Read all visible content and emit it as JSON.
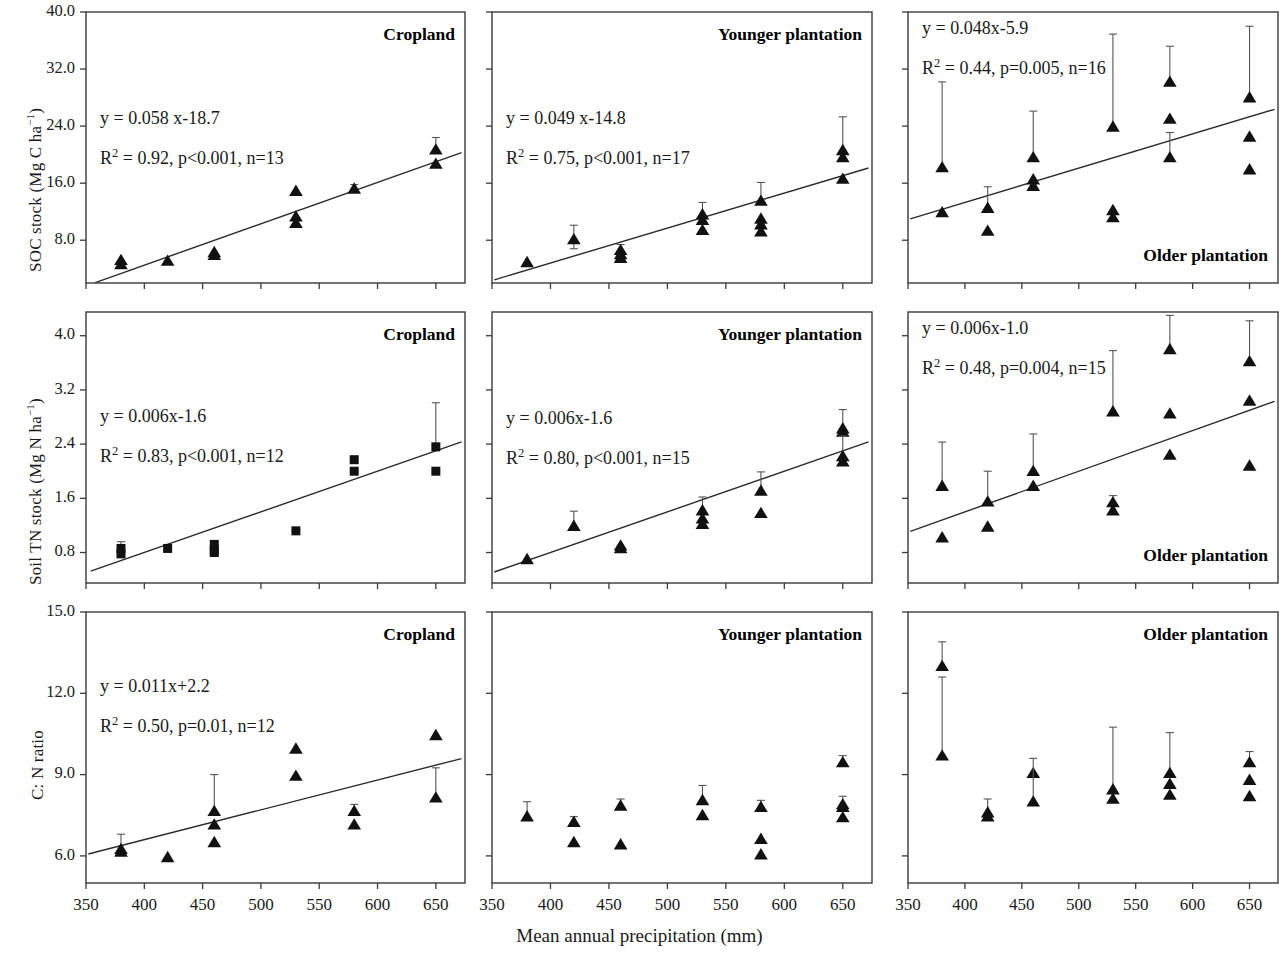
{
  "figure": {
    "xaxis_title": "Mean annual precipitation (mm)",
    "x_ticks": [
      "350",
      "400",
      "450",
      "500",
      "550",
      "600",
      "650"
    ],
    "x_tick_values": [
      350,
      400,
      450,
      500,
      550,
      600,
      650
    ],
    "xlim": [
      350,
      675
    ],
    "rows": [
      {
        "ylabel_main": "SOC stock (Mg C ha",
        "ylabel_sup": "−1",
        "ylabel_tail": ")",
        "y_ticks": [
          "8.0",
          "16.0",
          "24.0",
          "32.0",
          "40.0"
        ],
        "y_tick_values": [
          8.0,
          16.0,
          24.0,
          32.0,
          40.0
        ],
        "ylim": [
          2.0,
          40.0
        ]
      },
      {
        "ylabel_main": "Soil TN stock (Mg N ha",
        "ylabel_sup": "−1",
        "ylabel_tail": ")",
        "y_ticks": [
          "0.8",
          "1.6",
          "2.4",
          "3.2",
          "4.0"
        ],
        "y_tick_values": [
          0.8,
          1.6,
          2.4,
          3.2,
          4.0
        ],
        "ylim": [
          0.35,
          4.35
        ]
      },
      {
        "ylabel_main": "C: N ratio",
        "ylabel_sup": "",
        "ylabel_tail": "",
        "y_ticks": [
          "6.0",
          "9.0",
          "12.0",
          "15.0"
        ],
        "y_tick_values": [
          6.0,
          9.0,
          12.0,
          15.0
        ],
        "ylim": [
          5.0,
          15.0
        ]
      }
    ]
  },
  "chart_data": [
    {
      "id": "soc-cropland",
      "type": "scatter",
      "panel_title": "Cropland",
      "title_pos": "top-right",
      "marker": "triangle",
      "xlabel": "Mean annual precipitation (mm)",
      "ylabel": "SOC stock (Mg C ha-1)",
      "xlim": [
        350,
        675
      ],
      "ylim": [
        2.0,
        40.0
      ],
      "grid": false,
      "equation": "y = 0.058 x-18.7",
      "stats": "R2 = 0.92, p<0.001, n=13",
      "r2": "0.92",
      "p": "p<0.001",
      "n": "n=13",
      "fit": {
        "slope": 0.058,
        "intercept": -18.7,
        "x_start": 358,
        "x_end": 672
      },
      "points": [
        {
          "x": 380,
          "y": 5.2,
          "err_up": 0.0,
          "err_dn": 0.0
        },
        {
          "x": 380,
          "y": 4.6,
          "err_up": 0.0,
          "err_dn": 0.0
        },
        {
          "x": 420,
          "y": 5.1,
          "err_up": 0.0,
          "err_dn": 0.0
        },
        {
          "x": 460,
          "y": 6.3,
          "err_up": 0.0,
          "err_dn": 0.0
        },
        {
          "x": 460,
          "y": 5.9,
          "err_up": 0.0,
          "err_dn": 0.0
        },
        {
          "x": 530,
          "y": 14.9,
          "err_up": 0.0,
          "err_dn": 0.0
        },
        {
          "x": 530,
          "y": 11.3,
          "err_up": 0.0,
          "err_dn": 0.0
        },
        {
          "x": 530,
          "y": 10.4,
          "err_up": 0.0,
          "err_dn": 0.0
        },
        {
          "x": 580,
          "y": 15.2,
          "err_up": 0.6,
          "err_dn": 0.0
        },
        {
          "x": 650,
          "y": 20.7,
          "err_up": 1.7,
          "err_dn": 0.0
        },
        {
          "x": 650,
          "y": 18.7,
          "err_up": 0.0,
          "err_dn": 0.0
        }
      ]
    },
    {
      "id": "soc-younger",
      "type": "scatter",
      "panel_title": "Younger plantation",
      "title_pos": "top-right",
      "marker": "triangle",
      "xlim": [
        350,
        675
      ],
      "ylim": [
        2.0,
        40.0
      ],
      "grid": false,
      "equation": "y = 0.049 x-14.8",
      "stats": "R2 = 0.75, p<0.001, n=17",
      "r2": "0.75",
      "p": "p<0.001",
      "n": "n=17",
      "fit": {
        "slope": 0.049,
        "intercept": -14.8,
        "x_start": 352,
        "x_end": 672
      },
      "points": [
        {
          "x": 380,
          "y": 4.9,
          "err_up": 0.0,
          "err_dn": 0.0
        },
        {
          "x": 420,
          "y": 8.1,
          "err_up": 2.0,
          "err_dn": 1.3
        },
        {
          "x": 460,
          "y": 6.6,
          "err_up": 0.8,
          "err_dn": 0.0
        },
        {
          "x": 460,
          "y": 6.0,
          "err_up": 0.0,
          "err_dn": 0.0
        },
        {
          "x": 460,
          "y": 5.5,
          "err_up": 0.0,
          "err_dn": 0.0
        },
        {
          "x": 530,
          "y": 11.6,
          "err_up": 1.7,
          "err_dn": 0.0
        },
        {
          "x": 530,
          "y": 10.8,
          "err_up": 0.0,
          "err_dn": 0.0
        },
        {
          "x": 530,
          "y": 9.4,
          "err_up": 0.0,
          "err_dn": 0.0
        },
        {
          "x": 580,
          "y": 13.5,
          "err_up": 2.6,
          "err_dn": 0.0
        },
        {
          "x": 580,
          "y": 11.0,
          "err_up": 0.0,
          "err_dn": 0.0
        },
        {
          "x": 580,
          "y": 10.2,
          "err_up": 0.0,
          "err_dn": 0.0
        },
        {
          "x": 580,
          "y": 9.2,
          "err_up": 0.0,
          "err_dn": 0.0
        },
        {
          "x": 650,
          "y": 20.6,
          "err_up": 4.7,
          "err_dn": 0.0
        },
        {
          "x": 650,
          "y": 19.6,
          "err_up": 0.0,
          "err_dn": 0.0
        },
        {
          "x": 650,
          "y": 16.6,
          "err_up": 0.0,
          "err_dn": 0.0
        }
      ]
    },
    {
      "id": "soc-older",
      "type": "scatter",
      "panel_title": "Older plantation",
      "title_pos": "bottom-right",
      "marker": "triangle",
      "xlim": [
        350,
        675
      ],
      "ylim": [
        2.0,
        40.0
      ],
      "grid": false,
      "equation": "y = 0.048x-5.9",
      "stats": "R2 = 0.44, p=0.005, n=16",
      "r2": "0.44",
      "p": "p=0.005",
      "n": "n=16",
      "fit": {
        "slope": 0.048,
        "intercept": -5.9,
        "x_start": 352,
        "x_end": 672
      },
      "points": [
        {
          "x": 380,
          "y": 18.2,
          "err_up": 12.0,
          "err_dn": 0.0
        },
        {
          "x": 380,
          "y": 11.9,
          "err_up": 0.0,
          "err_dn": 0.0
        },
        {
          "x": 420,
          "y": 12.5,
          "err_up": 3.0,
          "err_dn": 0.0
        },
        {
          "x": 420,
          "y": 9.3,
          "err_up": 0.0,
          "err_dn": 0.0
        },
        {
          "x": 460,
          "y": 19.6,
          "err_up": 6.5,
          "err_dn": 0.0
        },
        {
          "x": 460,
          "y": 16.5,
          "err_up": 0.0,
          "err_dn": 0.0
        },
        {
          "x": 460,
          "y": 15.6,
          "err_up": 0.0,
          "err_dn": 0.0
        },
        {
          "x": 530,
          "y": 23.9,
          "err_up": 13.0,
          "err_dn": 0.0
        },
        {
          "x": 530,
          "y": 12.2,
          "err_up": 0.0,
          "err_dn": 0.0
        },
        {
          "x": 530,
          "y": 11.2,
          "err_up": 0.0,
          "err_dn": 0.0
        },
        {
          "x": 580,
          "y": 30.2,
          "err_up": 5.0,
          "err_dn": 0.0
        },
        {
          "x": 580,
          "y": 25.0,
          "err_up": 0.0,
          "err_dn": 0.0
        },
        {
          "x": 580,
          "y": 19.6,
          "err_up": 3.5,
          "err_dn": 0.0
        },
        {
          "x": 650,
          "y": 28.0,
          "err_up": 10.0,
          "err_dn": 0.0
        },
        {
          "x": 650,
          "y": 22.5,
          "err_up": 0.0,
          "err_dn": 0.0
        },
        {
          "x": 650,
          "y": 17.9,
          "err_up": 0.0,
          "err_dn": 0.0
        }
      ]
    },
    {
      "id": "tn-cropland",
      "type": "scatter",
      "panel_title": "Cropland",
      "title_pos": "top-right",
      "marker": "square",
      "xlim": [
        350,
        675
      ],
      "ylim": [
        0.35,
        4.35
      ],
      "grid": false,
      "equation": "y = 0.006x-1.6",
      "stats": "R2 = 0.83, p<0.001, n=12",
      "r2": "0.83",
      "p": "p<0.001",
      "n": "n=12",
      "fit": {
        "slope": 0.006,
        "intercept": -1.6,
        "x_start": 354,
        "x_end": 672
      },
      "points": [
        {
          "x": 380,
          "y": 0.86,
          "err_up": 0.1,
          "err_dn": 0.1
        },
        {
          "x": 380,
          "y": 0.78,
          "err_up": 0.0,
          "err_dn": 0.0
        },
        {
          "x": 420,
          "y": 0.86,
          "err_up": 0.04,
          "err_dn": 0.0
        },
        {
          "x": 460,
          "y": 0.92,
          "err_up": 0.0,
          "err_dn": 0.0
        },
        {
          "x": 460,
          "y": 0.84,
          "err_up": 0.0,
          "err_dn": 0.0
        },
        {
          "x": 460,
          "y": 0.8,
          "err_up": 0.0,
          "err_dn": 0.0
        },
        {
          "x": 530,
          "y": 1.12,
          "err_up": 0.0,
          "err_dn": 0.0
        },
        {
          "x": 580,
          "y": 2.17,
          "err_up": 0.0,
          "err_dn": 0.0
        },
        {
          "x": 580,
          "y": 2.0,
          "err_up": 0.0,
          "err_dn": 0.0
        },
        {
          "x": 650,
          "y": 2.36,
          "err_up": 0.65,
          "err_dn": 0.0
        },
        {
          "x": 650,
          "y": 2.0,
          "err_up": 0.0,
          "err_dn": 0.0
        }
      ]
    },
    {
      "id": "tn-younger",
      "type": "scatter",
      "panel_title": "Younger plantation",
      "title_pos": "top-right",
      "marker": "triangle",
      "xlim": [
        350,
        675
      ],
      "ylim": [
        0.35,
        4.35
      ],
      "grid": false,
      "equation": "y = 0.006x-1.6",
      "stats": "R2 = 0.80, p<0.001, n=15",
      "r2": "0.80",
      "p": "p<0.001",
      "n": "n=15",
      "fit": {
        "slope": 0.006,
        "intercept": -1.6,
        "x_start": 352,
        "x_end": 672
      },
      "points": [
        {
          "x": 380,
          "y": 0.7,
          "err_up": 0.0,
          "err_dn": 0.0
        },
        {
          "x": 420,
          "y": 1.19,
          "err_up": 0.22,
          "err_dn": 0.0
        },
        {
          "x": 460,
          "y": 0.9,
          "err_up": 0.0,
          "err_dn": 0.0
        },
        {
          "x": 460,
          "y": 0.86,
          "err_up": 0.0,
          "err_dn": 0.0
        },
        {
          "x": 530,
          "y": 1.42,
          "err_up": 0.2,
          "err_dn": 0.0
        },
        {
          "x": 530,
          "y": 1.3,
          "err_up": 0.0,
          "err_dn": 0.0
        },
        {
          "x": 530,
          "y": 1.22,
          "err_up": 0.0,
          "err_dn": 0.0
        },
        {
          "x": 580,
          "y": 1.71,
          "err_up": 0.28,
          "err_dn": 0.0
        },
        {
          "x": 580,
          "y": 1.38,
          "err_up": 0.0,
          "err_dn": 0.0
        },
        {
          "x": 650,
          "y": 2.63,
          "err_up": 0.28,
          "err_dn": 0.0
        },
        {
          "x": 650,
          "y": 2.58,
          "err_up": 0.0,
          "err_dn": 0.0
        },
        {
          "x": 650,
          "y": 2.22,
          "err_up": 0.3,
          "err_dn": 0.0
        },
        {
          "x": 650,
          "y": 2.14,
          "err_up": 0.0,
          "err_dn": 0.0
        }
      ]
    },
    {
      "id": "tn-older",
      "type": "scatter",
      "panel_title": "Older plantation",
      "title_pos": "bottom-right",
      "marker": "triangle",
      "xlim": [
        350,
        675
      ],
      "ylim": [
        0.35,
        4.35
      ],
      "grid": false,
      "equation": "y = 0.006x-1.0",
      "stats": "R2 = 0.48, p=0.004, n=15",
      "r2": "0.48",
      "p": "p=0.004",
      "n": "n=15",
      "fit": {
        "slope": 0.006,
        "intercept": -1.0,
        "x_start": 352,
        "x_end": 672
      },
      "points": [
        {
          "x": 380,
          "y": 1.78,
          "err_up": 0.65,
          "err_dn": 0.0
        },
        {
          "x": 380,
          "y": 1.02,
          "err_up": 0.0,
          "err_dn": 0.0
        },
        {
          "x": 420,
          "y": 1.55,
          "err_up": 0.45,
          "err_dn": 0.0
        },
        {
          "x": 420,
          "y": 1.18,
          "err_up": 0.0,
          "err_dn": 0.0
        },
        {
          "x": 460,
          "y": 2.0,
          "err_up": 0.55,
          "err_dn": 0.0
        },
        {
          "x": 460,
          "y": 1.78,
          "err_up": 0.0,
          "err_dn": 0.0
        },
        {
          "x": 530,
          "y": 2.88,
          "err_up": 0.9,
          "err_dn": 0.0
        },
        {
          "x": 530,
          "y": 1.54,
          "err_up": 0.1,
          "err_dn": 0.0
        },
        {
          "x": 530,
          "y": 1.42,
          "err_up": 0.0,
          "err_dn": 0.0
        },
        {
          "x": 580,
          "y": 3.8,
          "err_up": 0.5,
          "err_dn": 0.0
        },
        {
          "x": 580,
          "y": 2.85,
          "err_up": 0.0,
          "err_dn": 0.0
        },
        {
          "x": 580,
          "y": 2.24,
          "err_up": 0.0,
          "err_dn": 0.0
        },
        {
          "x": 650,
          "y": 3.62,
          "err_up": 0.6,
          "err_dn": 0.0
        },
        {
          "x": 650,
          "y": 3.04,
          "err_up": 0.0,
          "err_dn": 0.0
        },
        {
          "x": 650,
          "y": 2.08,
          "err_up": 0.0,
          "err_dn": 0.0
        }
      ]
    },
    {
      "id": "cn-cropland",
      "type": "scatter",
      "panel_title": "Cropland",
      "title_pos": "top-right",
      "marker": "triangle",
      "xlim": [
        350,
        675
      ],
      "ylim": [
        5.0,
        15.0
      ],
      "grid": false,
      "equation": "y  = 0.011x+2.2",
      "stats": "R2 = 0.50, p=0.01, n=12",
      "r2": "0.50",
      "p": "p=0.01",
      "n": "n=12",
      "fit": {
        "slope": 0.011,
        "intercept": 2.2,
        "x_start": 352,
        "x_end": 672
      },
      "points": [
        {
          "x": 380,
          "y": 6.25,
          "err_up": 0.55,
          "err_dn": 0.0
        },
        {
          "x": 380,
          "y": 6.15,
          "err_up": 0.0,
          "err_dn": 0.0
        },
        {
          "x": 420,
          "y": 5.95,
          "err_up": 0.0,
          "err_dn": 0.0
        },
        {
          "x": 460,
          "y": 7.65,
          "err_up": 1.35,
          "err_dn": 0.0
        },
        {
          "x": 460,
          "y": 7.15,
          "err_up": 0.0,
          "err_dn": 0.0
        },
        {
          "x": 460,
          "y": 6.5,
          "err_up": 0.0,
          "err_dn": 0.0
        },
        {
          "x": 530,
          "y": 9.95,
          "err_up": 0.0,
          "err_dn": 0.0
        },
        {
          "x": 530,
          "y": 8.95,
          "err_up": 0.0,
          "err_dn": 0.0
        },
        {
          "x": 580,
          "y": 7.65,
          "err_up": 0.25,
          "err_dn": 0.0
        },
        {
          "x": 580,
          "y": 7.15,
          "err_up": 0.0,
          "err_dn": 0.0
        },
        {
          "x": 650,
          "y": 10.45,
          "err_up": 0.0,
          "err_dn": 0.0
        },
        {
          "x": 650,
          "y": 8.15,
          "err_up": 1.1,
          "err_dn": 0.0
        }
      ]
    },
    {
      "id": "cn-younger",
      "type": "scatter",
      "panel_title": "Younger plantation",
      "title_pos": "top-right",
      "marker": "triangle",
      "xlim": [
        350,
        675
      ],
      "ylim": [
        5.0,
        15.0
      ],
      "grid": false,
      "equation": "",
      "stats": "",
      "r2": "",
      "p": "",
      "n": "",
      "fit": null,
      "points": [
        {
          "x": 380,
          "y": 7.45,
          "err_up": 0.55,
          "err_dn": 0.0
        },
        {
          "x": 420,
          "y": 7.25,
          "err_up": 0.2,
          "err_dn": 0.0
        },
        {
          "x": 420,
          "y": 6.5,
          "err_up": 0.0,
          "err_dn": 0.0
        },
        {
          "x": 460,
          "y": 7.85,
          "err_up": 0.25,
          "err_dn": 0.0
        },
        {
          "x": 460,
          "y": 6.42,
          "err_up": 0.0,
          "err_dn": 0.0
        },
        {
          "x": 530,
          "y": 8.05,
          "err_up": 0.55,
          "err_dn": 0.0
        },
        {
          "x": 530,
          "y": 7.5,
          "err_up": 0.0,
          "err_dn": 0.0
        },
        {
          "x": 580,
          "y": 7.8,
          "err_up": 0.25,
          "err_dn": 0.0
        },
        {
          "x": 580,
          "y": 6.62,
          "err_up": 0.0,
          "err_dn": 0.0
        },
        {
          "x": 580,
          "y": 6.05,
          "err_up": 0.0,
          "err_dn": 0.0
        },
        {
          "x": 650,
          "y": 9.45,
          "err_up": 0.25,
          "err_dn": 0.0
        },
        {
          "x": 650,
          "y": 7.9,
          "err_up": 0.3,
          "err_dn": 0.0
        },
        {
          "x": 650,
          "y": 7.8,
          "err_up": 0.0,
          "err_dn": 0.0
        },
        {
          "x": 650,
          "y": 7.42,
          "err_up": 0.0,
          "err_dn": 0.0
        }
      ]
    },
    {
      "id": "cn-older",
      "type": "scatter",
      "panel_title": "Older plantation",
      "title_pos": "top-right",
      "marker": "triangle",
      "xlim": [
        350,
        675
      ],
      "ylim": [
        5.0,
        15.0
      ],
      "grid": false,
      "equation": "",
      "stats": "",
      "r2": "",
      "p": "",
      "n": "",
      "fit": null,
      "points": [
        {
          "x": 380,
          "y": 13.0,
          "err_up": 0.9,
          "err_dn": 0.0
        },
        {
          "x": 380,
          "y": 9.7,
          "err_up": 2.9,
          "err_dn": 0.0
        },
        {
          "x": 420,
          "y": 7.6,
          "err_up": 0.5,
          "err_dn": 0.0
        },
        {
          "x": 420,
          "y": 7.45,
          "err_up": 0.0,
          "err_dn": 0.0
        },
        {
          "x": 460,
          "y": 9.05,
          "err_up": 0.0,
          "err_dn": 0.0
        },
        {
          "x": 460,
          "y": 8.0,
          "err_up": 1.6,
          "err_dn": 0.0
        },
        {
          "x": 530,
          "y": 8.45,
          "err_up": 2.3,
          "err_dn": 0.0
        },
        {
          "x": 530,
          "y": 8.1,
          "err_up": 0.0,
          "err_dn": 0.0
        },
        {
          "x": 580,
          "y": 9.05,
          "err_up": 1.5,
          "err_dn": 0.0
        },
        {
          "x": 580,
          "y": 8.65,
          "err_up": 0.0,
          "err_dn": 0.0
        },
        {
          "x": 580,
          "y": 8.25,
          "err_up": 0.0,
          "err_dn": 0.0
        },
        {
          "x": 650,
          "y": 9.45,
          "err_up": 0.4,
          "err_dn": 0.0
        },
        {
          "x": 650,
          "y": 8.8,
          "err_up": 0.0,
          "err_dn": 0.0
        },
        {
          "x": 650,
          "y": 8.2,
          "err_up": 0.0,
          "err_dn": 0.0
        }
      ]
    }
  ]
}
